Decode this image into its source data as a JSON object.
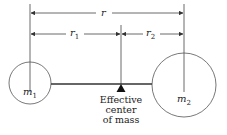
{
  "diagram": {
    "title": "Effective center of mass",
    "labels": {
      "r": "r",
      "r1_base": "r",
      "r1_sub": "1",
      "r2_base": "r",
      "r2_sub": "2",
      "m1_base": "m",
      "m1_sub": "1",
      "m2_base": "m",
      "m2_sub": "2"
    },
    "caption": {
      "line1": "Effective",
      "line2": "center",
      "line3": "of mass"
    },
    "colors": {
      "line": "#333333",
      "background": "#ffffff"
    }
  }
}
